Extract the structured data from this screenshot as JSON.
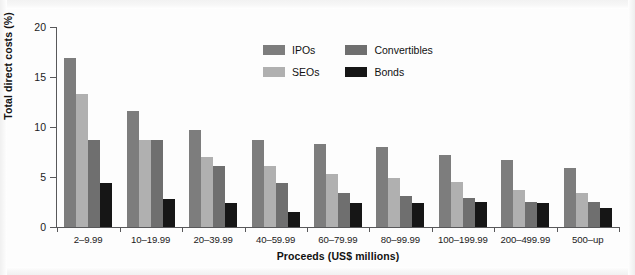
{
  "chart_data": {
    "type": "bar",
    "title": "",
    "xlabel": "Proceeds (US$ millions)",
    "ylabel": "Total direct costs (%)",
    "ylim": [
      0,
      20
    ],
    "yticks": [
      0,
      5,
      10,
      15,
      20
    ],
    "ytick_labels": [
      "0",
      "5",
      "10",
      "15",
      "20"
    ],
    "grid": false,
    "legend_position": "top-center",
    "categories": [
      "2–9.99",
      "10–19.99",
      "20–39.99",
      "40–59.99",
      "60–79.99",
      "80–99.99",
      "100–199.99",
      "200–499.99",
      "500–up"
    ],
    "series": [
      {
        "name": "IPOs",
        "color": "#7d7d7d",
        "values": [
          16.9,
          11.6,
          9.7,
          8.7,
          8.3,
          8.0,
          7.2,
          6.7,
          5.9
        ]
      },
      {
        "name": "SEOs",
        "color": "#b0b0b0",
        "values": [
          13.3,
          8.7,
          7.0,
          6.1,
          5.3,
          4.9,
          4.5,
          3.7,
          3.4
        ]
      },
      {
        "name": "Convertibles",
        "color": "#6f6f6f",
        "values": [
          8.7,
          8.7,
          6.1,
          4.4,
          3.4,
          3.1,
          2.9,
          2.5,
          2.5
        ]
      },
      {
        "name": "Bonds",
        "color": "#161616",
        "values": [
          4.4,
          2.8,
          2.4,
          1.5,
          2.4,
          2.4,
          2.5,
          2.4,
          1.9
        ]
      }
    ]
  },
  "legend": {
    "items": [
      {
        "label": "IPOs",
        "key": "ipos"
      },
      {
        "label": "Convertibles",
        "key": "convertibles"
      },
      {
        "label": "SEOs",
        "key": "seos"
      },
      {
        "label": "Bonds",
        "key": "bonds"
      }
    ]
  },
  "colors": {
    "ipos": "#7d7d7d",
    "seos": "#b0b0b0",
    "convertibles": "#6f6f6f",
    "bonds": "#161616",
    "axis": "#58585a",
    "background": "#ffffff"
  }
}
